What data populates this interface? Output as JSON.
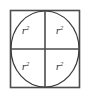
{
  "figure": {
    "type": "geometry-diagram",
    "colors": {
      "square_stroke": "#4d4d4d",
      "circle_stroke": "#3a3a3a",
      "divider_stroke": "#4d4d4d",
      "label_color": "#1a1a1a",
      "background": "#ffffff"
    },
    "square": {
      "x": 10,
      "y": 10,
      "width": 70,
      "height": 78,
      "stroke_width": 1.6
    },
    "circle": {
      "cx": 45,
      "cy": 49,
      "rx": 34,
      "ry": 38,
      "stroke_width": 1.2
    },
    "dividers": {
      "vertical_x": 45,
      "horizontal_y": 49,
      "stroke_width": 1.6
    },
    "quadrants": [
      {
        "id": "top-left",
        "base": "r",
        "exponent": "2"
      },
      {
        "id": "top-right",
        "base": "r",
        "exponent": "2"
      },
      {
        "id": "bottom-left",
        "base": "r",
        "exponent": "2"
      },
      {
        "id": "bottom-right",
        "base": "r",
        "exponent": "2"
      }
    ]
  }
}
